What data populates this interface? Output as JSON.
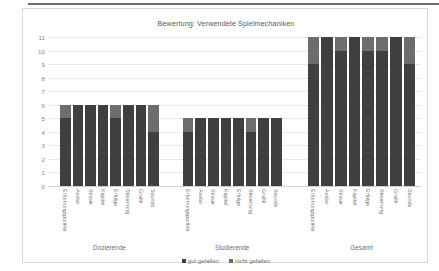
{
  "chart_data": {
    "type": "bar",
    "title": "Bewertung: Verwendete Spielmechaniken",
    "xlabel": "",
    "ylabel": "",
    "ylim": [
      0,
      11
    ],
    "yticks": [
      11,
      10,
      9,
      8,
      7,
      6,
      5,
      4,
      3,
      2,
      1,
      0
    ],
    "grid": true,
    "stacked": true,
    "legend_position": "bottom",
    "legend": [
      "gut gefallen",
      "nicht gefallen"
    ],
    "colors": {
      "gut gefallen": "#3f3f3f",
      "nicht gefallen": "#6d6d6d",
      "plot_background": "#ffffff",
      "gridline": "#e8e8e8",
      "border": "#d9d9d9",
      "text": "#7a7a7a"
    },
    "categories": [
      "Erfahrungspunkte",
      "Avatar",
      "Streak",
      "Kapitel",
      "Erfolge",
      "Steuerung",
      "Grafik",
      "Sounds"
    ],
    "groups": [
      {
        "name": "Dozierende",
        "total": 6,
        "series": [
          {
            "name": "gut gefallen",
            "values": [
              5,
              6,
              6,
              6,
              5,
              6,
              6,
              4
            ]
          },
          {
            "name": "nicht gefallen",
            "values": [
              1,
              0,
              0,
              0,
              1,
              0,
              0,
              2
            ]
          }
        ]
      },
      {
        "name": "Studierende",
        "total": 5,
        "series": [
          {
            "name": "gut gefallen",
            "values": [
              4,
              5,
              5,
              5,
              5,
              4,
              5,
              5
            ]
          },
          {
            "name": "nicht gefallen",
            "values": [
              1,
              0,
              0,
              0,
              0,
              1,
              0,
              0
            ]
          }
        ]
      },
      {
        "name": "Gesamt",
        "total": 11,
        "series": [
          {
            "name": "gut gefallen",
            "values": [
              9,
              11,
              10,
              11,
              10,
              10,
              11,
              9
            ]
          },
          {
            "name": "nicht gefallen",
            "values": [
              2,
              0,
              1,
              0,
              1,
              1,
              0,
              2
            ]
          }
        ]
      }
    ]
  }
}
